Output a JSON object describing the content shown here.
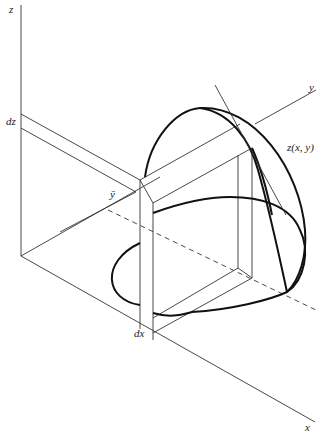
{
  "figure": {
    "colors": {
      "line": "#333333",
      "curve": "#111111",
      "background": "#ffffff"
    }
  },
  "labels": {
    "z_axis": "z",
    "y_axis": "y",
    "x_axis": "x",
    "dz": "dz",
    "dx": "dx",
    "y_bar": "ȳ",
    "surface": "z(x, y)"
  }
}
